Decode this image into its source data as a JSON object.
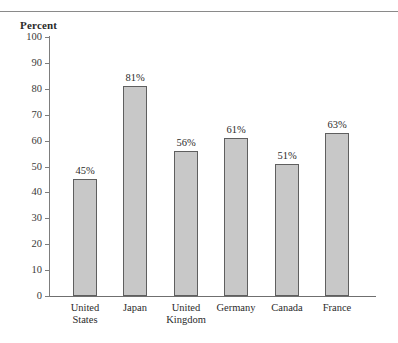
{
  "chart_data": {
    "type": "bar",
    "title": "",
    "subtitle": "",
    "xlabel": "",
    "ylabel": "Percent",
    "ylim": [
      0,
      100
    ],
    "ytick_step": 10,
    "yticks": [
      100,
      90,
      80,
      70,
      60,
      50,
      40,
      30,
      20,
      10,
      0
    ],
    "ytick_labels": [
      "100",
      "90",
      "80",
      "70",
      "60",
      "50",
      "40",
      "30",
      "20",
      "10",
      "0"
    ],
    "categories": [
      "United States",
      "Japan",
      "United Kingdom",
      "Germany",
      "Canada",
      "France"
    ],
    "category_lines": [
      [
        "United",
        "States"
      ],
      [
        "Japan",
        ""
      ],
      [
        "United",
        "Kingdom"
      ],
      [
        "Germany",
        ""
      ],
      [
        "Canada",
        ""
      ],
      [
        "France",
        ""
      ]
    ],
    "values": [
      45,
      81,
      56,
      61,
      51,
      63
    ],
    "data_labels": [
      "45%",
      "81%",
      "56%",
      "61%",
      "51%",
      "63%"
    ],
    "grid": false,
    "legend": false,
    "legend_position": "none",
    "bar_fill_color": "#c8c8c8",
    "bar_border_color": "#5f5f5f",
    "axis_color": "#7d7d7d",
    "text_color": "#2b2b2b",
    "background_color": "#ffffff"
  },
  "decor": {
    "top_rule_color": "#8a8a8a"
  }
}
